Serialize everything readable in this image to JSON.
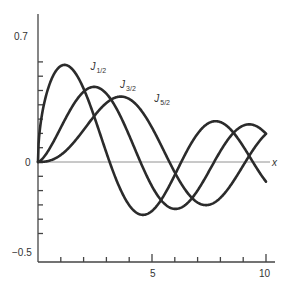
{
  "chart_data": {
    "type": "line",
    "title": "",
    "xlabel": "x",
    "ylabel": "",
    "xlim": [
      0,
      10.5
    ],
    "ylim": [
      -0.55,
      0.8
    ],
    "grid": false,
    "legend": "inline labels near curve peaks",
    "x_ticks": [
      1,
      2,
      3,
      4,
      5,
      6,
      7,
      8,
      9,
      10
    ],
    "x_tick_labels": [
      {
        "value": 5,
        "label": "5"
      },
      {
        "value": 10,
        "label": "10"
      }
    ],
    "y_ticks": [
      -0.5,
      -0.4,
      -0.3,
      -0.2,
      -0.1,
      0,
      0.1,
      0.2,
      0.3,
      0.4,
      0.5,
      0.6,
      0.7
    ],
    "y_tick_labels": [
      {
        "value": 0.7,
        "label": "0.7"
      },
      {
        "value": 0,
        "label": "0"
      },
      {
        "value": -0.5,
        "label": "-0.5"
      }
    ],
    "series": [
      {
        "name": "J_{1/2}",
        "label_main": "J",
        "label_sub": "1/2",
        "order": 0.5,
        "label_pos": [
          2.3,
          0.64
        ],
        "x": [
          0,
          0.5,
          1,
          1.5,
          2,
          2.5,
          3,
          3.5,
          4,
          4.5,
          5,
          5.5,
          6,
          6.5,
          7,
          7.5,
          8,
          8.5,
          9,
          9.5,
          10
        ],
        "values": [
          0,
          0.38,
          0.67,
          0.8,
          0.72,
          0.48,
          0.13,
          -0.28,
          -0.61,
          -0.78,
          -0.76,
          -0.55,
          -0.22,
          0.16,
          0.5,
          0.71,
          0.79,
          0.69,
          0.47,
          0.14,
          -0.14
        ]
      },
      {
        "name": "J_{3/2}",
        "label_main": "J",
        "label_sub": "3/2",
        "order": 1.5,
        "label_pos": [
          3.6,
          0.52
        ],
        "x": [
          0,
          0.5,
          1,
          1.5,
          2,
          2.5,
          3,
          3.5,
          4,
          4.5,
          5,
          5.5,
          6,
          6.5,
          7,
          7.5,
          8,
          8.5,
          9,
          9.5,
          10
        ],
        "values": [
          0,
          0.09,
          0.24,
          0.4,
          0.49,
          0.52,
          0.48,
          0.36,
          0.16,
          -0.07,
          -0.17,
          -0.3,
          -0.34,
          -0.28,
          -0.2,
          -0.02,
          0.14,
          0.26,
          0.31,
          0.27,
          0.2
        ]
      },
      {
        "name": "J_{5/2}",
        "label_main": "J",
        "label_sub": "5/2",
        "order": 2.5,
        "label_pos": [
          5.1,
          0.42
        ],
        "x": [
          0,
          0.5,
          1,
          1.5,
          2,
          2.5,
          3,
          3.5,
          4,
          4.5,
          5,
          5.5,
          6,
          6.5,
          7,
          7.5,
          8,
          8.5,
          9,
          9.5,
          10
        ],
        "values": [
          0,
          0.01,
          0.05,
          0.14,
          0.22,
          0.32,
          0.41,
          0.46,
          0.45,
          0.38,
          0.25,
          0.07,
          -0.13,
          -0.26,
          -0.32,
          -0.3,
          -0.21,
          -0.07,
          0.09,
          0.21,
          0.26
        ]
      }
    ]
  },
  "axis": {
    "x_name": "x",
    "label_0_7": "0.7",
    "label_0": "0",
    "label_neg_0_5": "−0.5",
    "label_5": "5",
    "label_10": "10"
  }
}
